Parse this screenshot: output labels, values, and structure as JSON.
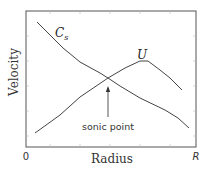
{
  "chart_data": {
    "type": "line",
    "title": "",
    "xlabel": "Radius",
    "ylabel": "Velocity",
    "x_ticks": [
      "0",
      "R"
    ],
    "grid": false,
    "legend": "inline curve labels",
    "series": [
      {
        "name": "Cs",
        "label_main": "C",
        "label_sub": "s",
        "description": "sound speed, decreasing with radius",
        "points_px": [
          [
            37,
            22
          ],
          [
            50,
            35
          ],
          [
            63,
            48
          ],
          [
            80,
            62
          ],
          [
            100,
            73
          ],
          [
            108,
            78
          ],
          [
            120,
            86
          ],
          [
            140,
            98
          ],
          [
            165,
            110
          ],
          [
            178,
            118
          ],
          [
            189,
            128
          ]
        ]
      },
      {
        "name": "U",
        "label_main": "U",
        "description": "flow velocity, rising then falling",
        "points_px": [
          [
            35,
            133
          ],
          [
            60,
            115
          ],
          [
            80,
            97
          ],
          [
            108,
            78
          ],
          [
            125,
            68
          ],
          [
            140,
            61
          ],
          [
            148,
            61
          ],
          [
            160,
            70
          ],
          [
            170,
            78
          ],
          [
            182,
            90
          ]
        ]
      }
    ],
    "annotations": [
      {
        "text": "sonic point",
        "arrow_from": [
          108,
          117
        ],
        "arrow_to": [
          108,
          87
        ]
      }
    ]
  },
  "labels": {
    "xlabel": "Radius",
    "ylabel": "Velocity",
    "x_tick_start": "0",
    "x_tick_end": "R",
    "cs_main": "C",
    "cs_sub": "s",
    "u_label": "U",
    "sonic_point": "sonic point"
  },
  "colors": {
    "frame": "#555555",
    "curve": "#444444",
    "text": "#333333"
  }
}
